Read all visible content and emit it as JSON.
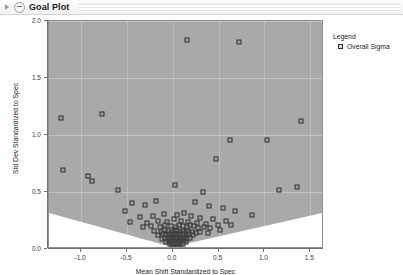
{
  "window": {
    "title": "Goal Plot",
    "disclosure_icon": "triangle-right-icon",
    "collapse_icon": "minus-circle-icon"
  },
  "legend": {
    "title": "Legend",
    "entries": [
      {
        "label": "Overall Sigma",
        "marker": "open-square-marker"
      }
    ]
  },
  "colors": {
    "plot_background": "#a9a9a9",
    "plot_border": "#8f8f8f",
    "goal_region": "#ffffff",
    "marker_edge": "#2e2e2e",
    "grid": "#ffffff",
    "axis": "#6f6f6f",
    "text": "#262626",
    "titlebar": "#f1f1f1"
  },
  "chart_data": {
    "type": "scatter",
    "title": "Goal Plot",
    "xlabel": "Mean Shift Standardized to Spec",
    "ylabel": "Std Dev Standardized to Spec",
    "xlim": [
      -1.35,
      1.65
    ],
    "ylim": [
      0.0,
      2.0
    ],
    "xticks": [
      -1.0,
      -0.5,
      0.0,
      0.5,
      1.0,
      1.5
    ],
    "xticklabels": [
      "-1.0",
      "-0.5",
      "0.0",
      "0.5",
      "1.0",
      "1.5"
    ],
    "yticks": [
      0.0,
      0.5,
      1.0,
      1.5,
      2.0
    ],
    "yticklabels": [
      "0.0",
      "0.5",
      "1.0",
      "1.5",
      "2.0"
    ],
    "grid": true,
    "legend_position": "right-outside",
    "goal_region": {
      "type": "triangular-wedge",
      "description": "White V-shaped capability goal region at bottom of plot",
      "apex": [
        0.0,
        0.0
      ],
      "left_edge": [
        -1.35,
        0.3
      ],
      "right_edge": [
        1.65,
        0.3
      ]
    },
    "series": [
      {
        "name": "Overall Sigma",
        "marker": "square-open",
        "points": [
          [
            0.15,
            1.83
          ],
          [
            0.72,
            1.82
          ],
          [
            -1.22,
            1.15
          ],
          [
            1.4,
            1.12
          ],
          [
            -0.77,
            1.18
          ],
          [
            1.03,
            0.96
          ],
          [
            0.47,
            0.79
          ],
          [
            0.62,
            0.96
          ],
          [
            -1.2,
            0.69
          ],
          [
            -0.92,
            0.64
          ],
          [
            -0.88,
            0.6
          ],
          [
            -0.6,
            0.52
          ],
          [
            0.02,
            0.56
          ],
          [
            0.33,
            0.5
          ],
          [
            1.36,
            0.54
          ],
          [
            1.16,
            0.52
          ],
          [
            -0.44,
            0.4
          ],
          [
            -0.3,
            0.39
          ],
          [
            -0.18,
            0.42
          ],
          [
            0.24,
            0.41
          ],
          [
            0.4,
            0.38
          ],
          [
            0.55,
            0.36
          ],
          [
            -0.52,
            0.33
          ],
          [
            0.68,
            0.33
          ],
          [
            0.86,
            0.3
          ],
          [
            -0.36,
            0.28
          ],
          [
            -0.22,
            0.29
          ],
          [
            -0.1,
            0.31
          ],
          [
            0.05,
            0.3
          ],
          [
            0.12,
            0.32
          ],
          [
            0.2,
            0.29
          ],
          [
            0.3,
            0.27
          ],
          [
            0.44,
            0.26
          ],
          [
            0.58,
            0.25
          ],
          [
            -0.47,
            0.24
          ],
          [
            -0.28,
            0.23
          ],
          [
            -0.16,
            0.25
          ],
          [
            -0.06,
            0.24
          ],
          [
            0.01,
            0.26
          ],
          [
            0.09,
            0.25
          ],
          [
            0.17,
            0.24
          ],
          [
            0.26,
            0.23
          ],
          [
            0.36,
            0.22
          ],
          [
            0.49,
            0.21
          ],
          [
            0.64,
            0.21
          ],
          [
            -0.33,
            0.19
          ],
          [
            -0.24,
            0.2
          ],
          [
            -0.14,
            0.19
          ],
          [
            -0.08,
            0.21
          ],
          [
            -0.02,
            0.2
          ],
          [
            0.03,
            0.19
          ],
          [
            0.07,
            0.21
          ],
          [
            0.11,
            0.2
          ],
          [
            0.15,
            0.19
          ],
          [
            0.19,
            0.21
          ],
          [
            0.23,
            0.2
          ],
          [
            0.28,
            0.18
          ],
          [
            0.34,
            0.19
          ],
          [
            0.41,
            0.18
          ],
          [
            0.52,
            0.17
          ],
          [
            -0.2,
            0.16
          ],
          [
            -0.13,
            0.15
          ],
          [
            -0.09,
            0.17
          ],
          [
            -0.05,
            0.16
          ],
          [
            -0.01,
            0.15
          ],
          [
            0.02,
            0.17
          ],
          [
            0.05,
            0.16
          ],
          [
            0.08,
            0.15
          ],
          [
            0.11,
            0.16
          ],
          [
            0.14,
            0.15
          ],
          [
            0.17,
            0.16
          ],
          [
            0.21,
            0.15
          ],
          [
            0.25,
            0.14
          ],
          [
            0.3,
            0.15
          ],
          [
            0.38,
            0.14
          ],
          [
            -0.16,
            0.12
          ],
          [
            -0.11,
            0.13
          ],
          [
            -0.07,
            0.12
          ],
          [
            -0.04,
            0.13
          ],
          [
            -0.02,
            0.12
          ],
          [
            0.0,
            0.13
          ],
          [
            0.02,
            0.12
          ],
          [
            0.04,
            0.13
          ],
          [
            0.06,
            0.12
          ],
          [
            0.08,
            0.13
          ],
          [
            0.1,
            0.12
          ],
          [
            0.12,
            0.13
          ],
          [
            0.15,
            0.12
          ],
          [
            0.18,
            0.13
          ],
          [
            0.22,
            0.12
          ],
          [
            -0.12,
            0.09
          ],
          [
            -0.08,
            0.1
          ],
          [
            -0.05,
            0.09
          ],
          [
            -0.03,
            0.1
          ],
          [
            -0.01,
            0.09
          ],
          [
            0.01,
            0.1
          ],
          [
            0.03,
            0.09
          ],
          [
            0.05,
            0.1
          ],
          [
            0.07,
            0.09
          ],
          [
            0.09,
            0.1
          ],
          [
            0.11,
            0.09
          ],
          [
            0.13,
            0.1
          ],
          [
            0.16,
            0.09
          ],
          [
            0.19,
            0.1
          ],
          [
            -0.07,
            0.06
          ],
          [
            -0.04,
            0.07
          ],
          [
            -0.02,
            0.06
          ],
          [
            0.0,
            0.07
          ],
          [
            0.02,
            0.06
          ],
          [
            0.04,
            0.07
          ],
          [
            0.06,
            0.06
          ],
          [
            0.08,
            0.07
          ],
          [
            0.1,
            0.06
          ],
          [
            0.12,
            0.07
          ],
          [
            0.14,
            0.06
          ],
          [
            -0.03,
            0.04
          ],
          [
            -0.01,
            0.04
          ],
          [
            0.01,
            0.04
          ],
          [
            0.03,
            0.04
          ],
          [
            0.05,
            0.04
          ],
          [
            0.07,
            0.04
          ],
          [
            0.09,
            0.04
          ],
          [
            0.11,
            0.04
          ],
          [
            0.0,
            0.02
          ],
          [
            0.03,
            0.02
          ],
          [
            0.06,
            0.02
          ]
        ]
      }
    ]
  }
}
